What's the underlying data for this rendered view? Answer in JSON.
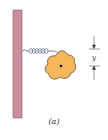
{
  "figure": {
    "caption": "(a)",
    "dimension_label": "y",
    "colors": {
      "wall": "#c98f9a",
      "wall_edge": "#8c5d67",
      "spring": "#6c7a9c",
      "body_fill": "#f5b759",
      "body_stroke": "#2a2a2a",
      "dimension_lines": "#333333"
    },
    "elements": {
      "wall": "vertical support wall",
      "spring": "coil spring",
      "body": "irregular rigid body with center point",
      "dimension": "vertical displacement y"
    }
  }
}
